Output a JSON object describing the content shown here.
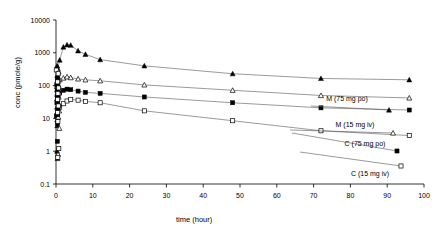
{
  "chart_data": {
    "type": "line",
    "title": "",
    "xlabel": "time (hour)",
    "ylabel": "conc (pmole/g)",
    "xlim": [
      0,
      100
    ],
    "ylim": [
      0.1,
      10000
    ],
    "yscale": "log",
    "xscale": "linear",
    "grid": false,
    "legend_position": "inline-right",
    "xticks": [
      0,
      10,
      20,
      30,
      40,
      50,
      60,
      70,
      80,
      90,
      100
    ],
    "xtick_labels": [
      "0",
      "10",
      "20",
      "30",
      "40",
      "50",
      "60",
      "70",
      "80",
      "90",
      "100"
    ],
    "yticks": [
      0.1,
      1,
      10,
      100,
      1000,
      10000
    ],
    "ytick_labels": [
      "0.1",
      "1",
      "10",
      "100",
      "1000",
      "10000"
    ],
    "series": [
      {
        "name": "M (75 mg po)",
        "marker": "filled-triangle",
        "x": [
          0.25,
          0.5,
          1,
          2,
          3,
          4,
          6,
          8,
          12,
          24,
          48,
          72,
          96
        ],
        "y": [
          120,
          330,
          600,
          1500,
          1750,
          1700,
          1150,
          900,
          620,
          400,
          230,
          165,
          150
        ]
      },
      {
        "name": "M (15 mg iv)",
        "marker": "open-triangle",
        "x": [
          0.25,
          0.5,
          1,
          2,
          3,
          4,
          6,
          8,
          12,
          24,
          48,
          72,
          96
        ],
        "y": [
          95,
          130,
          150,
          170,
          185,
          175,
          160,
          150,
          140,
          105,
          72,
          50,
          42
        ]
      },
      {
        "name": "C (75 mg po)",
        "marker": "filled-square",
        "x": [
          0.083,
          0.25,
          0.5,
          1,
          2,
          3,
          4,
          6,
          8,
          12,
          24,
          48,
          72,
          96
        ],
        "y": [
          12,
          30,
          48,
          60,
          72,
          78,
          75,
          68,
          62,
          58,
          45,
          30,
          21,
          18
        ]
      },
      {
        "name": "C (15 mg iv)",
        "marker": "open-square",
        "x": [
          0.083,
          0.25,
          0.5,
          1,
          2,
          3,
          4,
          6,
          8,
          12,
          24,
          48,
          72,
          96
        ],
        "y": [
          300,
          110,
          40,
          22,
          28,
          34,
          38,
          36,
          33,
          30,
          17,
          8.5,
          4.2,
          3.0
        ]
      }
    ],
    "early_cluster_note": "dense overlapping points between t=0 and t=1 spanning 0.6 to 400 pmole/g"
  },
  "labels": {
    "series0": "M (75 mg po)",
    "series1": "M (15 mg iv)",
    "series2": "C (75 mg po)",
    "series3": "C (15 mg iv)",
    "xaxis": "time (hour)",
    "yaxis": "conc (pmole/g)"
  }
}
